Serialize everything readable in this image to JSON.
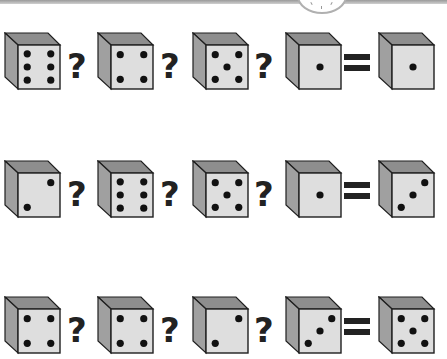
{
  "colors": {
    "top_face": "#8e8e8e",
    "side_face": "#a0a0a0",
    "front_face": "#dedede",
    "outline": "#1e1e1e",
    "pip": "#111111",
    "operator": "#222222"
  },
  "operators": {
    "unknown": "?",
    "equals": "="
  },
  "rows": [
    {
      "top": 32,
      "dice": [
        6,
        4,
        5,
        1,
        1
      ]
    },
    {
      "top": 160,
      "dice": [
        2,
        6,
        5,
        1,
        3
      ]
    },
    {
      "top": 296,
      "dice": [
        4,
        4,
        2,
        3,
        5
      ]
    }
  ]
}
